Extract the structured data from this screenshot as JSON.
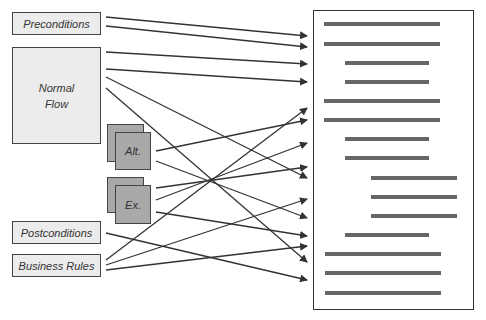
{
  "diagram": {
    "sources": {
      "preconditions": "Preconditions",
      "normal_flow_line1": "Normal",
      "normal_flow_line2": "Flow",
      "alt": "Alt.",
      "ex": "Ex.",
      "postconditions": "Postconditions",
      "business_rules": "Business Rules"
    },
    "target": "document with 15 requirement lines",
    "colors": {
      "box_fill": "#ececec",
      "card_fill": "#a9a9a9",
      "border": "#444444",
      "bar": "#666666",
      "arrow": "#333333"
    }
  }
}
